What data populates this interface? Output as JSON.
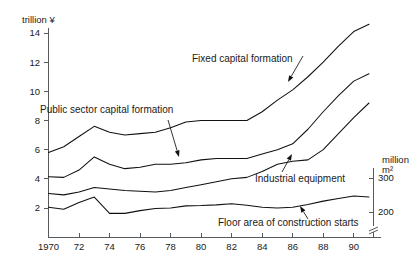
{
  "chart_data": {
    "type": "line",
    "title": "",
    "xlabel": "",
    "ylabel": "trillion ¥",
    "y2label_line1": "million",
    "y2label_line2": "m²",
    "xlim": [
      1970,
      1991
    ],
    "ylim": [
      0,
      15
    ],
    "y2lim": [
      150,
      330
    ],
    "grid": false,
    "legend_position": "inline-annotations",
    "x": [
      1970,
      1971,
      1972,
      1973,
      1974,
      1975,
      1976,
      1977,
      1978,
      1979,
      1980,
      1981,
      1982,
      1983,
      1984,
      1985,
      1986,
      1987,
      1988,
      1989,
      1990,
      1991
    ],
    "xticks": [
      1970,
      1972,
      1974,
      1976,
      1978,
      1980,
      1982,
      1984,
      1986,
      1988,
      1990
    ],
    "xtick_labels": [
      "1970",
      "72",
      "74",
      "76",
      "78",
      "80",
      "82",
      "84",
      "86",
      "88",
      "90"
    ],
    "yticks": [
      2,
      4,
      6,
      8,
      10,
      12,
      14
    ],
    "ytick_labels": [
      "2",
      "4",
      "6",
      "8",
      "10",
      "12",
      "14"
    ],
    "y2ticks": [
      200,
      300
    ],
    "y2tick_labels": [
      "200",
      "300"
    ],
    "y2_axis_break": true,
    "series": [
      {
        "name": "Fixed capital formation",
        "axis": "left",
        "units": "trillion ¥",
        "values": [
          5.8,
          6.2,
          6.9,
          7.6,
          7.2,
          7.0,
          7.1,
          7.2,
          7.5,
          7.9,
          8.0,
          8.0,
          8.0,
          8.0,
          8.6,
          9.4,
          10.1,
          11.0,
          12.0,
          13.1,
          14.1,
          14.6
        ]
      },
      {
        "name": "Public sector capital formation",
        "axis": "left",
        "units": "trillion ¥",
        "values": [
          4.15,
          4.1,
          4.6,
          5.5,
          5.0,
          4.7,
          4.8,
          5.0,
          5.0,
          5.1,
          5.3,
          5.4,
          5.4,
          5.4,
          5.7,
          6.0,
          6.4,
          7.4,
          8.6,
          9.7,
          10.7,
          11.2
        ]
      },
      {
        "name": "Industrial equipment",
        "axis": "left",
        "units": "trillion ¥",
        "values": [
          3.0,
          2.9,
          3.1,
          3.4,
          3.3,
          3.2,
          3.15,
          3.1,
          3.2,
          3.4,
          3.6,
          3.8,
          4.0,
          4.1,
          4.5,
          5.0,
          5.2,
          5.3,
          6.0,
          7.1,
          8.2,
          9.2
        ]
      },
      {
        "name": "Floor area of construction starts",
        "axis": "right",
        "units": "million m²",
        "values": [
          214,
          208,
          228,
          244,
          196,
          196,
          204,
          210,
          212,
          218,
          219,
          221,
          224,
          220,
          214,
          212,
          214,
          222,
          232,
          240,
          247,
          244
        ]
      }
    ],
    "annotations": [
      {
        "name": "fixed-capital-formation",
        "text": "Fixed capital formation",
        "label_x": 192,
        "label_y": 62,
        "leader_from_x": 303,
        "leader_from_y": 56,
        "leader_to_x": 288,
        "leader_to_y": 82
      },
      {
        "name": "public-sector-capital-formation",
        "text": "Public sector capital formation",
        "label_x": 40,
        "label_y": 113,
        "leader_from_x": 168,
        "leader_from_y": 120,
        "leader_to_x": 179,
        "leader_to_y": 157
      },
      {
        "name": "industrial-equipment",
        "text": "Industrial equipment",
        "label_x": 255,
        "label_y": 182,
        "leader_from_x": 282,
        "leader_from_y": 172,
        "leader_to_x": 292,
        "leader_to_y": 154
      },
      {
        "name": "floor-area-of-construction-starts",
        "text": "Floor area of construction starts",
        "label_x": 218,
        "label_y": 226,
        "leader_from_x": 308,
        "leader_from_y": 219,
        "leader_to_x": 300,
        "leader_to_y": 206
      }
    ]
  }
}
